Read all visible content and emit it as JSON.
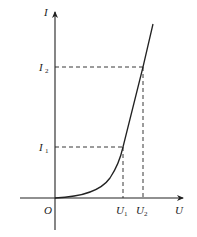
{
  "diagram": {
    "type": "I-U characteristic curve",
    "colors": {
      "line": "#222222",
      "background": "#ffffff"
    },
    "axes": {
      "x": {
        "label": "U"
      },
      "y": {
        "label": "I"
      },
      "origin_label": "O"
    },
    "ticks": {
      "x": [
        {
          "base": "U",
          "sub": "1"
        },
        {
          "base": "U",
          "sub": "2"
        }
      ],
      "y": [
        {
          "base": "I",
          "sub": "1"
        },
        {
          "base": "I",
          "sub": "2"
        }
      ]
    },
    "marked_points": [
      {
        "name": "P1",
        "x_label": "U1",
        "y_label": "I1"
      },
      {
        "name": "P2",
        "x_label": "U2",
        "y_label": "I2"
      }
    ],
    "curve": {
      "shape": "nonlinear, increasing; flat near origin then steepening to near-linear"
    }
  }
}
